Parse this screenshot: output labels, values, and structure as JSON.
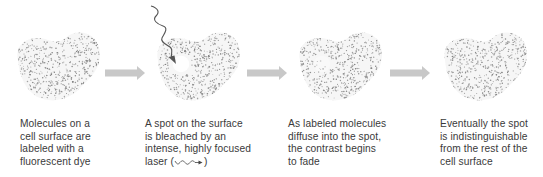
{
  "figure": {
    "colors": {
      "dots": "#7a7a7a",
      "arrow": "#c8c8c8",
      "laser": "#555555",
      "text": "#3a3a3a",
      "background": "#ffffff"
    },
    "steps": [
      {
        "id": "labeled",
        "cell_state": "uniformly-labeled",
        "caption_lines": [
          "Molecules on a",
          "cell surface are",
          "labeled with a",
          "fluorescent dye"
        ]
      },
      {
        "id": "bleached",
        "cell_state": "bleached-spot",
        "caption_lines": [
          "A spot on the surface",
          "is bleached by an",
          "intense, highly focused"
        ],
        "caption_last_prefix": "laser (",
        "caption_last_suffix": ")",
        "inline_icon": "laser-wave-icon"
      },
      {
        "id": "diffusing",
        "cell_state": "fading-spot",
        "caption_lines": [
          "As labeled molecules",
          "diffuse into the spot,",
          "the contrast begins",
          "to fade"
        ]
      },
      {
        "id": "recovered",
        "cell_state": "uniform-again",
        "caption_lines": [
          "Eventually the spot",
          "is indistinguishable",
          "from the rest of the",
          "cell surface"
        ]
      }
    ],
    "arrows": [
      "step-arrow",
      "step-arrow",
      "step-arrow"
    ]
  }
}
